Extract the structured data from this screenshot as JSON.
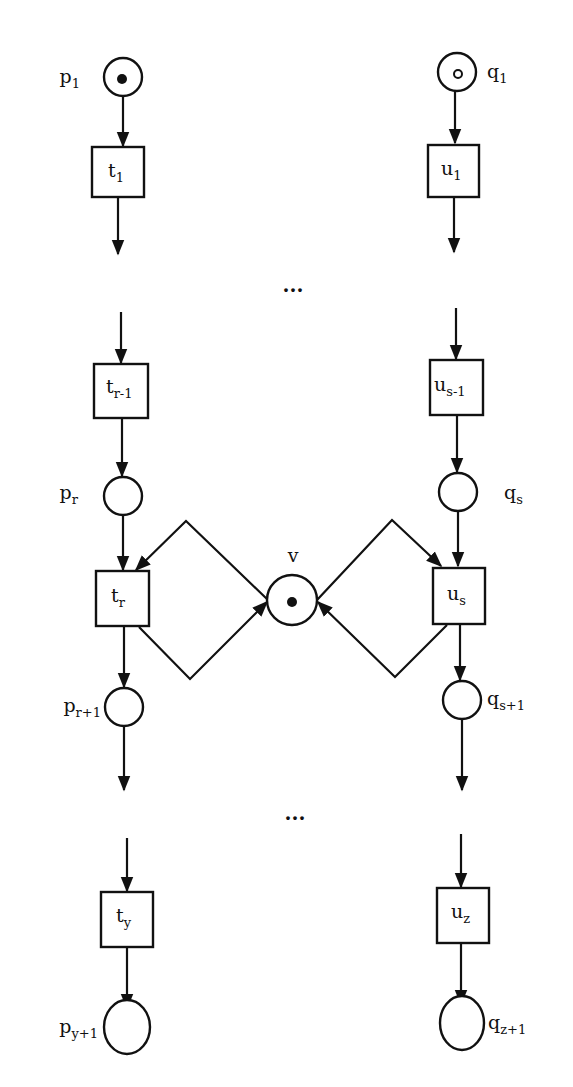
{
  "diagram": {
    "type": "petri-net",
    "places": [
      {
        "id": "p1",
        "base": "p",
        "sub": "1",
        "x": 123,
        "y": 77,
        "tokens": "filled",
        "label_side": "left"
      },
      {
        "id": "q1",
        "base": "q",
        "sub": "1",
        "x": 458,
        "y": 72,
        "tokens": "hollow",
        "label_side": "right"
      },
      {
        "id": "pr",
        "base": "p",
        "sub": "r",
        "x": 123,
        "y": 496,
        "tokens": "none",
        "label_side": "left"
      },
      {
        "id": "qs",
        "base": "q",
        "sub": "s",
        "x": 458,
        "y": 492,
        "tokens": "none",
        "label_side": "right"
      },
      {
        "id": "v",
        "base": "v",
        "sub": "",
        "x": 292,
        "y": 600,
        "tokens": "filled",
        "label_side": "top"
      },
      {
        "id": "pr1",
        "base": "p",
        "sub": "r+1",
        "x": 124,
        "y": 707,
        "tokens": "none",
        "label_side": "left"
      },
      {
        "id": "qs1",
        "base": "q",
        "sub": "s+1",
        "x": 462,
        "y": 700,
        "tokens": "none",
        "label_side": "right"
      },
      {
        "id": "py1",
        "base": "p",
        "sub": "y+1",
        "x": 124,
        "y": 1027,
        "tokens": "none",
        "label_side": "left"
      },
      {
        "id": "qz1",
        "base": "q",
        "sub": "z+1",
        "x": 458,
        "y": 1023,
        "tokens": "none",
        "label_side": "right"
      }
    ],
    "transitions": [
      {
        "id": "t1",
        "base": "t",
        "sub": "1",
        "x": 118,
        "y": 172
      },
      {
        "id": "u1",
        "base": "u",
        "sub": "1",
        "x": 454,
        "y": 170
      },
      {
        "id": "tr_1",
        "base": "t",
        "sub": "r-1",
        "x": 122,
        "y": 390
      },
      {
        "id": "us_1",
        "base": "u",
        "sub": "s-1",
        "x": 456,
        "y": 387
      },
      {
        "id": "tr",
        "base": "t",
        "sub": "r",
        "x": 122,
        "y": 598
      },
      {
        "id": "us",
        "base": "u",
        "sub": "s",
        "x": 459,
        "y": 595
      },
      {
        "id": "ty",
        "base": "t",
        "sub": "y",
        "x": 123,
        "y": 919
      },
      {
        "id": "uz",
        "base": "u",
        "sub": "z",
        "x": 457,
        "y": 915
      }
    ],
    "ellipsis": [
      "...",
      "..."
    ],
    "labels": {
      "p1": {
        "base": "p",
        "sub": "1"
      },
      "q1": {
        "base": "q",
        "sub": "1"
      },
      "t1": {
        "base": "t",
        "sub": "1"
      },
      "u1": {
        "base": "u",
        "sub": "1"
      },
      "tr_1": {
        "base": "t",
        "sub": "r-1"
      },
      "us_1": {
        "base": "u",
        "sub": "s-1"
      },
      "pr": {
        "base": "p",
        "sub": "r"
      },
      "qs": {
        "base": "q",
        "sub": "s"
      },
      "tr": {
        "base": "t",
        "sub": "r"
      },
      "us": {
        "base": "u",
        "sub": "s"
      },
      "v": {
        "base": "v"
      },
      "pr1": {
        "base": "p",
        "sub": "r+1"
      },
      "qs1": {
        "base": "q",
        "sub": "s+1"
      },
      "ty": {
        "base": "t",
        "sub": "y"
      },
      "uz": {
        "base": "u",
        "sub": "z"
      },
      "py1": {
        "base": "p",
        "sub": "y+1"
      },
      "qz1": {
        "base": "q",
        "sub": "z+1"
      }
    },
    "colors": {
      "stroke": "#111111",
      "background": "#ffffff"
    }
  }
}
